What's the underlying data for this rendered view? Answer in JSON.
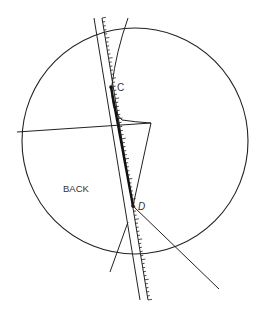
{
  "diagram": {
    "labels": {
      "point_c": "C",
      "point_d": "D",
      "region": "BACK"
    },
    "stroke_color": "#222222",
    "background": "#ffffff"
  }
}
